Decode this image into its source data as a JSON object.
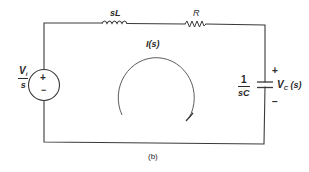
{
  "figure": {
    "caption": "(b)",
    "wire_color": "#3a3a3a",
    "text_color": "#2a2a2a"
  },
  "components": {
    "source": {
      "type": "voltage-source",
      "label_num": "V",
      "label_num_sub": "i",
      "label_den": "s",
      "plus": "+",
      "minus": "−"
    },
    "inductor": {
      "type": "inductor",
      "label": "sL"
    },
    "resistor": {
      "type": "resistor",
      "label": "R"
    },
    "capacitor": {
      "type": "capacitor",
      "label_num": "1",
      "label_den": "sC",
      "voltage_label": "V",
      "voltage_sub": "C",
      "voltage_arg": " (s)",
      "plus": "+",
      "minus": "−"
    }
  },
  "loop_current": {
    "label": "I(s)",
    "direction": "clockwise"
  }
}
